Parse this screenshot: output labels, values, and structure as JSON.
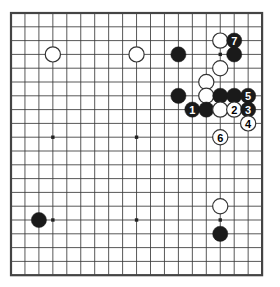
{
  "diagram": {
    "kind": "go-board-diagram",
    "board_size": 19,
    "visible_grid": {
      "cols": 18,
      "rows": 19
    },
    "geometry": {
      "origin_x": 11,
      "origin_y": 13,
      "step_x": 13.95,
      "step_y": 13.8,
      "stone_radius": 7.6,
      "border_width": 259,
      "border_height": 261
    },
    "colors": {
      "background": "#ffffff",
      "grid_line": "#3a3a3a",
      "border_line": "#444444",
      "black_stone": "#1a1a1a",
      "white_stone_fill": "#ffffff",
      "white_stone_edge": "#333333",
      "black_number_text": "#ffffff",
      "white_number_text": "#000000",
      "star_point": "#222222"
    },
    "star_points": [
      {
        "col": 3,
        "row": 3
      },
      {
        "col": 9,
        "row": 3
      },
      {
        "col": 15,
        "row": 3
      },
      {
        "col": 3,
        "row": 9
      },
      {
        "col": 9,
        "row": 9
      },
      {
        "col": 15,
        "row": 9
      },
      {
        "col": 3,
        "row": 15
      },
      {
        "col": 9,
        "row": 15
      },
      {
        "col": 15,
        "row": 15
      }
    ],
    "stones": [
      {
        "id": "w-c3r3",
        "color": "white",
        "col": 3,
        "row": 3,
        "label": ""
      },
      {
        "id": "w-c9r3",
        "color": "white",
        "col": 9,
        "row": 3,
        "label": ""
      },
      {
        "id": "b-c12r3",
        "color": "black",
        "col": 12,
        "row": 3,
        "label": ""
      },
      {
        "id": "w-c15r2",
        "color": "white",
        "col": 15,
        "row": 2,
        "label": ""
      },
      {
        "id": "b-c16r2",
        "color": "black",
        "col": 16,
        "row": 2,
        "label": "7"
      },
      {
        "id": "b-c16r3",
        "color": "black",
        "col": 16,
        "row": 3,
        "label": ""
      },
      {
        "id": "w-c15r4",
        "color": "white",
        "col": 15,
        "row": 4,
        "label": ""
      },
      {
        "id": "w-c14r5",
        "color": "white",
        "col": 14,
        "row": 5,
        "label": ""
      },
      {
        "id": "b-c12r6",
        "color": "black",
        "col": 12,
        "row": 6,
        "label": ""
      },
      {
        "id": "w-c14r6",
        "color": "white",
        "col": 14,
        "row": 6,
        "label": ""
      },
      {
        "id": "b-c15r6",
        "color": "black",
        "col": 15,
        "row": 6,
        "label": ""
      },
      {
        "id": "b-c16r6",
        "color": "black",
        "col": 16,
        "row": 6,
        "label": ""
      },
      {
        "id": "b-c17r6",
        "color": "black",
        "col": 17,
        "row": 6,
        "label": "5"
      },
      {
        "id": "b-c13r7",
        "color": "black",
        "col": 13,
        "row": 7,
        "label": "1"
      },
      {
        "id": "b-c14r7",
        "color": "black",
        "col": 14,
        "row": 7,
        "label": ""
      },
      {
        "id": "w-c15r7",
        "color": "white",
        "col": 15,
        "row": 7,
        "label": ""
      },
      {
        "id": "w-c16r7",
        "color": "white",
        "col": 16,
        "row": 7,
        "label": "2"
      },
      {
        "id": "b-c17r7",
        "color": "black",
        "col": 17,
        "row": 7,
        "label": "3"
      },
      {
        "id": "w-c17r8",
        "color": "white",
        "col": 17,
        "row": 8,
        "label": "4"
      },
      {
        "id": "w-c15r9",
        "color": "white",
        "col": 15,
        "row": 9,
        "label": "6"
      },
      {
        "id": "b-c3r15",
        "color": "black",
        "col": 2,
        "row": 15,
        "label": ""
      },
      {
        "id": "w-c15r14",
        "color": "white",
        "col": 15,
        "row": 14,
        "label": ""
      },
      {
        "id": "b-c15r16",
        "color": "black",
        "col": 15,
        "row": 16,
        "label": ""
      }
    ],
    "move_sequence": [
      {
        "number": "1",
        "color": "black"
      },
      {
        "number": "2",
        "color": "white"
      },
      {
        "number": "3",
        "color": "black"
      },
      {
        "number": "4",
        "color": "white"
      },
      {
        "number": "5",
        "color": "black"
      },
      {
        "number": "6",
        "color": "white"
      },
      {
        "number": "7",
        "color": "black"
      }
    ]
  }
}
